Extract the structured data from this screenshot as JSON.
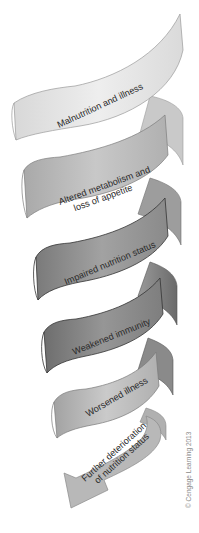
{
  "diagram": {
    "type": "downward-spiral",
    "stages": [
      {
        "id": "malnutrition",
        "label_lines": [
          "Malnutrition and illness"
        ],
        "color": "#e6e6e6"
      },
      {
        "id": "altered",
        "label_lines": [
          "Altered metabolism and",
          "loss of appetite"
        ],
        "color": "#bdbdbd"
      },
      {
        "id": "impaired",
        "label_lines": [
          "Impaired nutrition status"
        ],
        "color": "#8e8e8e"
      },
      {
        "id": "weakened",
        "label_lines": [
          "Weakened immunity"
        ],
        "color": "#7d7d7d"
      },
      {
        "id": "worsened",
        "label_lines": [
          "Worsened illness"
        ],
        "color": "#b4b4b4"
      },
      {
        "id": "further",
        "label_lines": [
          "Further deterioration",
          "of nutrition status"
        ],
        "color": "#b8b8b8"
      }
    ],
    "credit": "© Cengage Learning 2013"
  }
}
